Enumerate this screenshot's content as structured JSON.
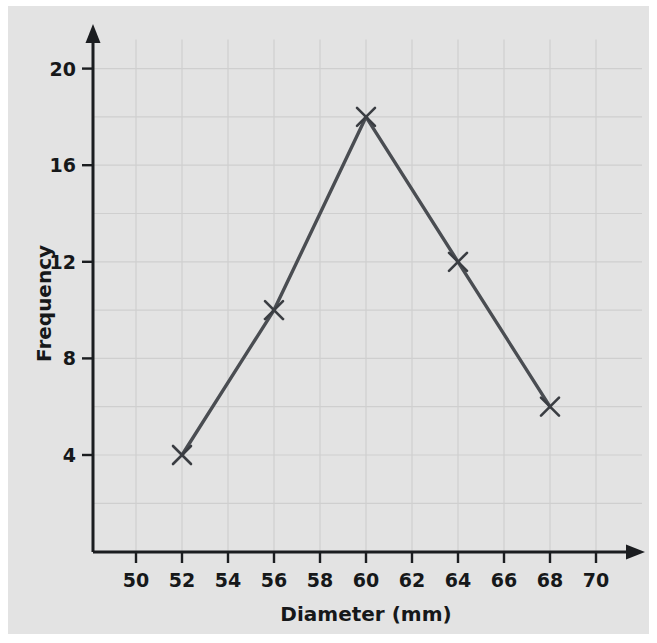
{
  "chart_data": {
    "type": "line",
    "title": "",
    "subtitle": "",
    "xlabel": "Diameter (mm)",
    "ylabel": "Frequency",
    "x": [
      52,
      56,
      60,
      64,
      68
    ],
    "values": [
      4,
      10,
      18,
      12,
      6
    ],
    "series": [
      {
        "name": "Frequency polygon",
        "x": [
          52,
          56,
          60,
          64,
          68
        ],
        "values": [
          4,
          10,
          18,
          12,
          6
        ]
      }
    ],
    "xlim": [
      48,
      71
    ],
    "ylim": [
      0,
      21.5
    ],
    "x_ticks": [
      50,
      52,
      54,
      56,
      58,
      60,
      62,
      64,
      66,
      68,
      70
    ],
    "x_tick_labels": [
      "50",
      "52",
      "54",
      "56",
      "58",
      "60",
      "62",
      "64",
      "66",
      "68",
      "70"
    ],
    "y_ticks": [
      4,
      8,
      12,
      16,
      20
    ],
    "y_tick_labels": [
      "4",
      "8",
      "12",
      "16",
      "20"
    ],
    "grid": true,
    "grid_x_step": 2,
    "grid_y_step": 2,
    "legend": "none",
    "marker": "x-cross",
    "annotations": [],
    "colors": {
      "background": "#e3e3e3",
      "page": "#ffffff",
      "grid": "#cfcfcf",
      "axis": "#1b1d20",
      "line": "#4a4d52",
      "marker": "#3a3d42",
      "text": "#16181a"
    }
  }
}
